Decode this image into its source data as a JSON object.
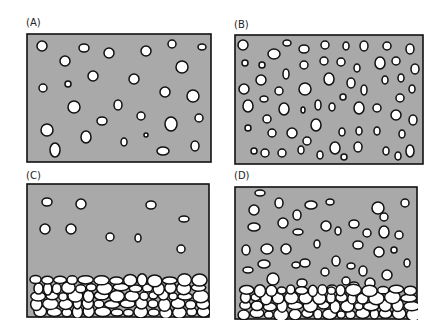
{
  "colors": {
    "fill": "#a9a9a9",
    "bubble": "#ffffff",
    "stroke": "#111111"
  },
  "panels": [
    {
      "label": "(A)",
      "lx": 26,
      "ly": 17,
      "x": 26,
      "y": 33,
      "w": 186,
      "h": 130,
      "bubbles": [
        [
          16,
          13,
          5,
          5
        ],
        [
          58,
          15,
          5,
          4
        ],
        [
          83,
          20,
          5,
          5
        ],
        [
          120,
          18,
          5,
          5
        ],
        [
          146,
          11,
          4,
          4
        ],
        [
          176,
          14,
          4,
          3
        ],
        [
          39,
          28,
          5,
          5
        ],
        [
          67,
          43,
          5,
          5
        ],
        [
          108,
          46,
          5,
          5
        ],
        [
          156,
          34,
          6,
          6
        ],
        [
          17,
          55,
          4,
          4
        ],
        [
          42,
          51,
          3,
          3
        ],
        [
          139,
          59,
          5,
          5
        ],
        [
          167,
          63,
          6,
          6
        ],
        [
          48,
          74,
          6,
          6
        ],
        [
          92,
          72,
          4,
          5
        ],
        [
          76,
          88,
          5,
          4
        ],
        [
          115,
          83,
          4,
          4
        ],
        [
          145,
          91,
          6,
          7
        ],
        [
          173,
          85,
          4,
          4
        ],
        [
          21,
          97,
          6,
          6
        ],
        [
          60,
          104,
          5,
          6
        ],
        [
          98,
          109,
          3,
          4
        ],
        [
          120,
          102,
          2,
          2
        ],
        [
          29,
          117,
          5,
          7
        ],
        [
          137,
          118,
          6,
          4
        ],
        [
          169,
          113,
          4,
          5
        ]
      ]
    },
    {
      "label": "(B)",
      "lx": 234,
      "ly": 19,
      "x": 234,
      "y": 34,
      "w": 190,
      "h": 131,
      "bubbles": [
        [
          9,
          11,
          5,
          5
        ],
        [
          40,
          20,
          6,
          5
        ],
        [
          53,
          9,
          4,
          3
        ],
        [
          70,
          15,
          5,
          4
        ],
        [
          91,
          11,
          4,
          4
        ],
        [
          112,
          12,
          3,
          4
        ],
        [
          130,
          12,
          4,
          5
        ],
        [
          153,
          12,
          4,
          4
        ],
        [
          176,
          15,
          4,
          5
        ],
        [
          11,
          29,
          3,
          3
        ],
        [
          28,
          31,
          3,
          3
        ],
        [
          70,
          31,
          4,
          4
        ],
        [
          90,
          27,
          4,
          4
        ],
        [
          107,
          28,
          4,
          4
        ],
        [
          123,
          34,
          3,
          4
        ],
        [
          146,
          29,
          5,
          6
        ],
        [
          162,
          27,
          4,
          4
        ],
        [
          181,
          35,
          4,
          5
        ],
        [
          52,
          40,
          3,
          5
        ],
        [
          27,
          46,
          5,
          5
        ],
        [
          95,
          45,
          5,
          6
        ],
        [
          117,
          49,
          4,
          5
        ],
        [
          151,
          46,
          3,
          4
        ],
        [
          167,
          44,
          3,
          4
        ],
        [
          10,
          55,
          5,
          5
        ],
        [
          45,
          57,
          4,
          4
        ],
        [
          71,
          55,
          6,
          6
        ],
        [
          130,
          56,
          3,
          5
        ],
        [
          178,
          55,
          3,
          4
        ],
        [
          30,
          65,
          4,
          3
        ],
        [
          109,
          63,
          3,
          3
        ],
        [
          166,
          64,
          4,
          4
        ],
        [
          14,
          72,
          5,
          6
        ],
        [
          50,
          75,
          5,
          6
        ],
        [
          69,
          76,
          2,
          3
        ],
        [
          84,
          71,
          3,
          5
        ],
        [
          98,
          73,
          3,
          4
        ],
        [
          125,
          74,
          5,
          6
        ],
        [
          143,
          74,
          4,
          4
        ],
        [
          162,
          81,
          5,
          5
        ],
        [
          33,
          85,
          4,
          4
        ],
        [
          82,
          91,
          5,
          6
        ],
        [
          179,
          86,
          4,
          5
        ],
        [
          14,
          94,
          3,
          3
        ],
        [
          38,
          99,
          4,
          4
        ],
        [
          58,
          99,
          5,
          5
        ],
        [
          108,
          98,
          3,
          4
        ],
        [
          125,
          97,
          3,
          4
        ],
        [
          143,
          97,
          3,
          4
        ],
        [
          168,
          100,
          3,
          4
        ],
        [
          73,
          107,
          4,
          4
        ],
        [
          20,
          117,
          3,
          3
        ],
        [
          31,
          119,
          4,
          4
        ],
        [
          48,
          119,
          4,
          4
        ],
        [
          67,
          116,
          3,
          4
        ],
        [
          101,
          114,
          5,
          6
        ],
        [
          124,
          113,
          4,
          5
        ],
        [
          152,
          117,
          3,
          4
        ],
        [
          176,
          117,
          4,
          6
        ],
        [
          86,
          121,
          3,
          4
        ],
        [
          110,
          123,
          3,
          3
        ],
        [
          164,
          122,
          3,
          4
        ]
      ]
    },
    {
      "label": "(C)",
      "lx": 26,
      "ly": 170,
      "x": 26,
      "y": 183,
      "w": 184,
      "h": 135,
      "bubbles": [
        [
          21,
          19,
          5,
          4
        ],
        [
          55,
          21,
          5,
          5
        ],
        [
          125,
          22,
          5,
          4
        ],
        [
          158,
          36,
          5,
          3
        ],
        [
          19,
          46,
          5,
          5
        ],
        [
          45,
          46,
          5,
          5
        ],
        [
          84,
          54,
          4,
          4
        ],
        [
          112,
          55,
          3,
          4
        ],
        [
          155,
          66,
          4,
          4
        ]
      ],
      "pack_top": 95,
      "pack_top_left": 100
    },
    {
      "label": "(D)",
      "lx": 234,
      "ly": 170,
      "x": 234,
      "y": 186,
      "w": 184,
      "h": 134,
      "bubbles": [
        [
          26,
          7,
          5,
          3
        ],
        [
          45,
          17,
          4,
          5
        ],
        [
          77,
          19,
          6,
          4
        ],
        [
          96,
          16,
          4,
          3
        ],
        [
          144,
          22,
          6,
          6
        ],
        [
          171,
          17,
          4,
          4
        ],
        [
          20,
          24,
          5,
          5
        ],
        [
          63,
          29,
          4,
          5
        ],
        [
          120,
          38,
          5,
          4
        ],
        [
          150,
          31,
          4,
          4
        ],
        [
          49,
          37,
          5,
          5
        ],
        [
          92,
          40,
          5,
          5
        ],
        [
          150,
          46,
          5,
          6
        ],
        [
          20,
          41,
          6,
          4
        ],
        [
          64,
          46,
          5,
          3
        ],
        [
          104,
          45,
          3,
          4
        ],
        [
          133,
          47,
          4,
          4
        ],
        [
          165,
          49,
          4,
          4
        ],
        [
          160,
          64,
          3,
          3
        ],
        [
          12,
          64,
          4,
          5
        ],
        [
          33,
          63,
          6,
          5
        ],
        [
          52,
          63,
          5,
          5
        ],
        [
          83,
          58,
          3,
          4
        ],
        [
          124,
          59,
          5,
          4
        ],
        [
          145,
          66,
          5,
          5
        ],
        [
          173,
          77,
          3,
          4
        ],
        [
          71,
          77,
          5,
          4
        ],
        [
          102,
          75,
          4,
          5
        ],
        [
          117,
          80,
          4,
          3
        ],
        [
          129,
          85,
          4,
          5
        ],
        [
          14,
          84,
          5,
          3
        ],
        [
          30,
          78,
          6,
          4
        ],
        [
          62,
          79,
          4,
          3
        ],
        [
          91,
          86,
          4,
          4
        ],
        [
          112,
          95,
          4,
          4
        ],
        [
          153,
          89,
          5,
          5
        ],
        [
          39,
          93,
          6,
          6
        ],
        [
          68,
          97,
          5,
          4
        ],
        [
          98,
          103,
          5,
          4
        ],
        [
          120,
          100,
          5,
          4
        ],
        [
          136,
          97,
          5,
          5
        ]
      ],
      "pack_top": 100
    }
  ]
}
